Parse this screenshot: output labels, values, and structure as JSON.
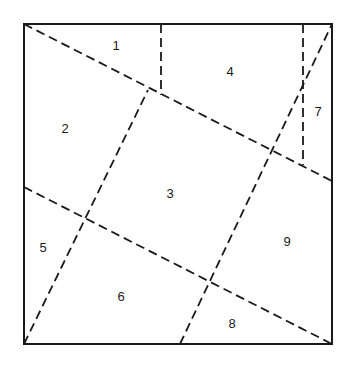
{
  "diagram": {
    "square": {
      "x1": 24,
      "y1": 24,
      "x2": 332,
      "y2": 344,
      "stroke": "#1a1a1a"
    },
    "dashed_lines": [
      {
        "id": "diag-top-left-to-right",
        "x1": 24,
        "y1": 24,
        "x2": 332,
        "y2": 181
      },
      {
        "id": "diag-left-to-bottom-right",
        "x1": 24,
        "y1": 187,
        "x2": 332,
        "y2": 344
      },
      {
        "id": "diag-bottom-left-up",
        "x1": 24,
        "y1": 344,
        "x2": 148,
        "y2": 90
      },
      {
        "id": "diag-bottom-to-top-right",
        "x1": 180,
        "y1": 344,
        "x2": 332,
        "y2": 24
      },
      {
        "id": "vertical-left",
        "x1": 161,
        "y1": 24,
        "x2": 161,
        "y2": 95
      },
      {
        "id": "vertical-right",
        "x1": 303,
        "y1": 24,
        "x2": 303,
        "y2": 165
      }
    ],
    "regions": [
      {
        "label": "1",
        "x": 116,
        "y": 50
      },
      {
        "label": "2",
        "x": 65,
        "y": 133
      },
      {
        "label": "3",
        "x": 170,
        "y": 198
      },
      {
        "label": "4",
        "x": 230,
        "y": 76
      },
      {
        "label": "5",
        "x": 43,
        "y": 252
      },
      {
        "label": "6",
        "x": 121,
        "y": 301
      },
      {
        "label": "7",
        "x": 318,
        "y": 116
      },
      {
        "label": "8",
        "x": 232,
        "y": 328
      },
      {
        "label": "9",
        "x": 287,
        "y": 246
      }
    ]
  }
}
